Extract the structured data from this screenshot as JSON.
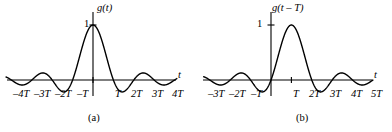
{
  "figure": {
    "width": 392,
    "height": 132,
    "background": "#ffffff",
    "stroke_color": "#000000"
  },
  "panels": [
    {
      "id": "a",
      "caption": "(a)",
      "caption_x": 88,
      "caption_y": 113,
      "function_label": "g(t)",
      "function_label_x": 97,
      "function_label_y": 3,
      "axis_label": "t",
      "axis_label_x": 178,
      "axis_label_y": 70,
      "amplitude_label": "1",
      "amplitude_label_x": 84,
      "amplitude_label_y": 19,
      "geometry": {
        "origin_x": 93,
        "baseline_y": 80,
        "peak_y": 25,
        "period_px": 20.4,
        "x_axis_start": 7,
        "x_axis_end": 176,
        "y_axis_top": 12,
        "y_axis_bottom": 96,
        "shift": 0
      },
      "ticks": [
        {
          "label": "–4T",
          "t": -4,
          "x": 13,
          "y": 89
        },
        {
          "label": "–3T",
          "t": -3,
          "x": 34,
          "y": 89
        },
        {
          "label": "–2T",
          "t": -2,
          "x": 55,
          "y": 89
        },
        {
          "label": "–T",
          "t": -1,
          "x": 77,
          "y": 89
        },
        {
          "label": "T",
          "t": 1,
          "x": 115,
          "y": 89
        },
        {
          "label": "2T",
          "t": 2,
          "x": 131,
          "y": 89
        },
        {
          "label": "3T",
          "t": 3,
          "x": 152,
          "y": 89
        },
        {
          "label": "4T",
          "t": 4,
          "x": 172,
          "y": 89
        }
      ]
    },
    {
      "id": "b",
      "caption": "(b)",
      "caption_x": 100,
      "caption_y": 113,
      "function_label": "g(t – T)",
      "function_label_x": 76,
      "function_label_y": 3,
      "axis_label": "t",
      "axis_label_x": 178,
      "axis_label_y": 70,
      "amplitude_label": "1",
      "amplitude_label_x": 61,
      "amplitude_label_y": 19,
      "geometry": {
        "origin_x": 75,
        "baseline_y": 80,
        "peak_y": 25,
        "period_px": 20.4,
        "x_axis_start": 7,
        "x_axis_end": 176,
        "y_axis_top": 12,
        "y_axis_bottom": 96,
        "shift": 1
      },
      "ticks": [
        {
          "label": "–3T",
          "t": -3,
          "x": 12,
          "y": 89
        },
        {
          "label": "–2T",
          "t": -2,
          "x": 33,
          "y": 89
        },
        {
          "label": "–T",
          "t": -1,
          "x": 55,
          "y": 89
        },
        {
          "label": "T",
          "t": 1,
          "x": 97,
          "y": 89
        },
        {
          "label": "2T",
          "t": 2,
          "x": 113,
          "y": 89
        },
        {
          "label": "3T",
          "t": 3,
          "x": 134,
          "y": 89
        },
        {
          "label": "4T",
          "t": 4,
          "x": 155,
          "y": 89
        },
        {
          "label": "5T",
          "t": 5,
          "x": 175,
          "y": 89
        }
      ]
    }
  ],
  "chart_data": {
    "type": "line",
    "title": "",
    "xlabel": "t",
    "ylabel": "",
    "grid": false,
    "legend": null,
    "series": [
      {
        "name": "g(t)",
        "panel": "a",
        "formula": "sinc(t/T)",
        "x": [
          -4,
          -3.5,
          -3,
          -2.5,
          -2,
          -1.5,
          -1,
          -0.5,
          0,
          0.5,
          1,
          1.5,
          2,
          2.5,
          3,
          3.5,
          4
        ],
        "y": [
          0,
          0.091,
          0,
          -0.127,
          0,
          0.212,
          0,
          -0.637,
          1,
          0.637,
          0,
          -0.212,
          0,
          0.127,
          0,
          -0.091,
          0
        ],
        "xlim": [
          -4.3,
          4.3
        ],
        "ylim": [
          -0.3,
          1.05
        ],
        "zero_crossings": [
          -4,
          -3,
          -2,
          -1,
          1,
          2,
          3,
          4
        ],
        "peak": {
          "x": 0,
          "y": 1
        }
      },
      {
        "name": "g(t - T)",
        "panel": "b",
        "formula": "sinc((t-T)/T)",
        "x": [
          -3,
          -2.5,
          -2,
          -1.5,
          -1,
          -0.5,
          0,
          0.5,
          1,
          1.5,
          2,
          2.5,
          3,
          3.5,
          4,
          4.5,
          5
        ],
        "y": [
          0,
          0.091,
          0,
          -0.127,
          0,
          0.212,
          0,
          -0.637,
          1,
          0.637,
          0,
          -0.212,
          0,
          0.127,
          0,
          -0.091,
          0
        ],
        "xlim": [
          -3.3,
          5.3
        ],
        "ylim": [
          -0.3,
          1.05
        ],
        "zero_crossings": [
          -3,
          -2,
          -1,
          0,
          2,
          3,
          4,
          5
        ],
        "peak": {
          "x": 1,
          "y": 1
        }
      }
    ]
  }
}
